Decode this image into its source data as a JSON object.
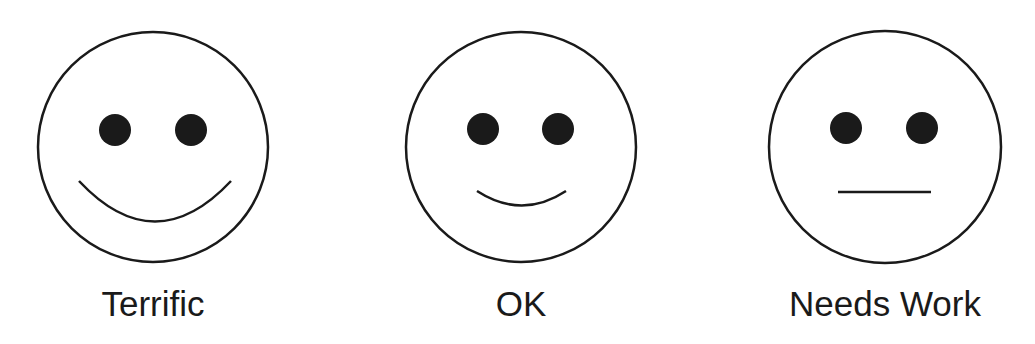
{
  "colors": {
    "stroke": "#1a1a1a",
    "background": "#ffffff"
  },
  "faces": [
    {
      "label": "Terrific",
      "mood": "big-smile",
      "cx": 153,
      "cy": 147,
      "r": 115,
      "eyes": [
        {
          "cx": 115,
          "cy": 130
        },
        {
          "cx": 191,
          "cy": 130
        }
      ],
      "mouth": "M 79 181 Q 155 262 231 181"
    },
    {
      "label": "OK",
      "mood": "small-smile",
      "cx": 521,
      "cy": 147,
      "r": 115,
      "eyes": [
        {
          "cx": 483,
          "cy": 129
        },
        {
          "cx": 558,
          "cy": 129
        }
      ],
      "mouth": "M 477 191 Q 522 220 566 191"
    },
    {
      "label": "Needs Work",
      "mood": "neutral",
      "cx": 885,
      "cy": 147,
      "r": 116,
      "eyes": [
        {
          "cx": 846,
          "cy": 128
        },
        {
          "cx": 922,
          "cy": 128
        }
      ],
      "mouth": "M 838 192 L 931 192"
    }
  ]
}
